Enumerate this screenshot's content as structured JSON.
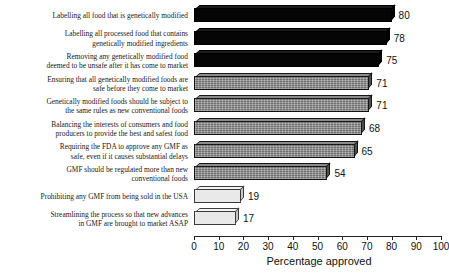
{
  "chart_data": {
    "type": "bar",
    "orientation": "horizontal",
    "title": "",
    "xlabel": "Percentage approved",
    "ylabel": "",
    "xlim": [
      0,
      100
    ],
    "xticks": [
      0,
      10,
      20,
      30,
      40,
      50,
      60,
      70,
      80,
      90,
      100
    ],
    "grid": false,
    "legend": null,
    "categories": [
      "Labelling all food that is genetically modified",
      "Labelling all processed food that contains genetically modified ingredients",
      "Removing any genetically modified food deemed to be unsafe after it has come to market",
      "Ensuring that all genetically modified foods are safe before they come to market",
      "Genetically modified foods should be subject to the same rules as new conventional foods",
      "Balancing the interests of consumers and food producers to provide the best and safest food",
      "Requiring the FDA to approve any GMF as safe, even if it causes substantial delays",
      "GMF should be regulated more than new conventional foods",
      "Prohibiting any GMF from being sold in the USA",
      "Streamlining the process so that new advances in GMF are brought to market ASAP"
    ],
    "values": [
      80,
      78,
      75,
      71,
      71,
      68,
      65,
      54,
      19,
      17
    ]
  },
  "bars": [
    {
      "lines": [
        "Labelling all food that is genetically modified"
      ],
      "value": 80,
      "value_text": "80",
      "shade": "dark"
    },
    {
      "lines": [
        "Labelling all processed food that contains",
        "genetically modified ingredients"
      ],
      "value": 78,
      "value_text": "78",
      "shade": "dark"
    },
    {
      "lines": [
        "Removing any genetically modified food",
        "deemed to be unsafe after it has come to market"
      ],
      "value": 75,
      "value_text": "75",
      "shade": "dark"
    },
    {
      "lines": [
        "Ensuring that all genetically modified foods are",
        "safe before they come to market"
      ],
      "value": 71,
      "value_text": "71",
      "shade": "mid"
    },
    {
      "lines": [
        "Genetically modified foods should be subject to",
        "the same rules as new conventional foods"
      ],
      "value": 71,
      "value_text": "71",
      "shade": "mid"
    },
    {
      "lines": [
        "Balancing the interests of consumers and food",
        "producers to provide the best and safest food"
      ],
      "value": 68,
      "value_text": "68",
      "shade": "mid"
    },
    {
      "lines": [
        "Requiring the FDA to approve any GMF as",
        "safe, even if it causes substantial delays"
      ],
      "value": 65,
      "value_text": "65",
      "shade": "mid"
    },
    {
      "lines": [
        "GMF should be regulated more than new",
        "conventional foods"
      ],
      "value": 54,
      "value_text": "54",
      "shade": "mid"
    },
    {
      "lines": [
        "Prohibiting any GMF from being sold in the USA"
      ],
      "value": 19,
      "value_text": "19",
      "shade": "light"
    },
    {
      "lines": [
        "Streamlining the process so that new advances",
        "in GMF are brought to market ASAP"
      ],
      "value": 17,
      "value_text": "17",
      "shade": "light"
    }
  ],
  "axis": {
    "ticks": [
      "0",
      "10",
      "20",
      "30",
      "40",
      "50",
      "60",
      "70",
      "80",
      "90",
      "100"
    ],
    "title": "Percentage approved"
  },
  "colors": {
    "dark": "#050505",
    "mid": "#6e6e6e",
    "light": "#e9e9e9",
    "text": "#111111",
    "axis": "#222222"
  }
}
